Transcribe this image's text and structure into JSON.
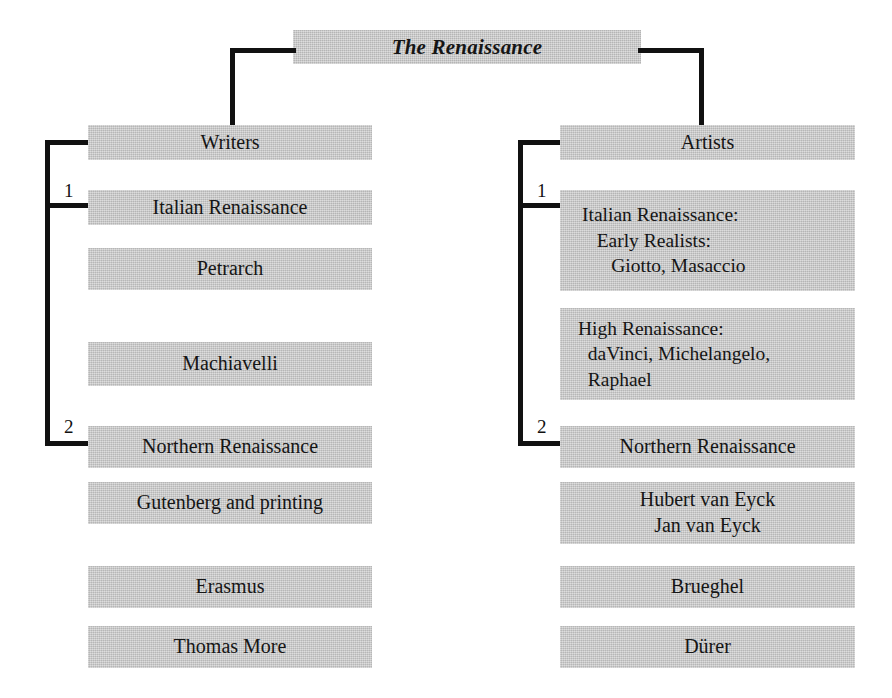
{
  "diagram": {
    "title_box": {
      "label": "The Renaissance"
    },
    "branches": [
      {
        "heading": "Writers",
        "index_labels": {
          "one": "1",
          "two": "2"
        },
        "sections": [
          {
            "index": "1",
            "label": "Italian Renaissance"
          },
          {
            "index": "2",
            "label": "Northern Renaissance"
          }
        ],
        "italian_items": [
          "Petrarch",
          "Machiavelli"
        ],
        "northern_items": [
          "Gutenberg and printing",
          "Erasmus",
          "Thomas More"
        ]
      },
      {
        "heading": "Artists",
        "index_labels": {
          "one": "1",
          "two": "2"
        },
        "sections": [
          {
            "index": "1",
            "label": "Italian Renaissance:\n   Early Realists:\n      Giotto, Masaccio"
          },
          {
            "index": "2",
            "label": "Northern Renaissance"
          }
        ],
        "italian_items": [
          "High Renaissance:\n  daVinci, Michelangelo,\n  Raphael"
        ],
        "northern_items": [
          "Hubert van Eyck\nJan van Eyck",
          "Brueghel",
          "Dürer"
        ]
      }
    ],
    "colors": {
      "box_fill": "#c8c8c8",
      "line": "#111111",
      "text": "#151515",
      "background": "#ffffff"
    }
  }
}
